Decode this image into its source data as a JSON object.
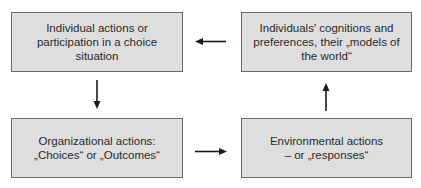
{
  "diagram": {
    "boxes": [
      {
        "id": "individual-actions",
        "label": "Individual actions or\nparticipation in a choice\nsituation"
      },
      {
        "id": "cognitions",
        "label": "Individuals' cognitions and\npreferences, their „models of\nthe world“"
      },
      {
        "id": "organizational-actions",
        "label": "Organizational actions:\n„Choices“ or „Outcomes“"
      },
      {
        "id": "environmental-actions",
        "label": "Environmental actions\n– or „responses“"
      }
    ],
    "arrows": [
      {
        "from": "cognitions",
        "to": "individual-actions",
        "direction": "left"
      },
      {
        "from": "individual-actions",
        "to": "organizational-actions",
        "direction": "down"
      },
      {
        "from": "organizational-actions",
        "to": "environmental-actions",
        "direction": "right"
      },
      {
        "from": "environmental-actions",
        "to": "cognitions",
        "direction": "up"
      }
    ],
    "colors": {
      "box_fill": "#dedede",
      "box_border": "#6a6a6a",
      "arrow": "#1a1a1a"
    }
  }
}
